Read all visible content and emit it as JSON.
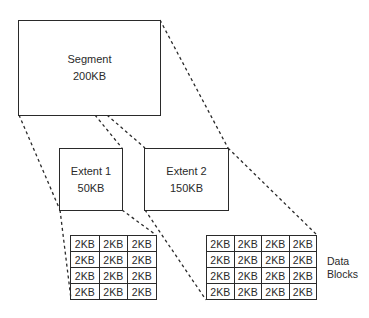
{
  "diagram": {
    "type": "storage hierarchy",
    "segment": {
      "title": "Segment",
      "size": "200KB"
    },
    "extents": [
      {
        "title": "Extent 1",
        "size": "50KB"
      },
      {
        "title": "Extent 2",
        "size": "150KB"
      }
    ],
    "data_blocks": {
      "label_line1": "Data",
      "label_line2": "Blocks",
      "block_size": "2KB",
      "grid1": {
        "rows": 4,
        "cols": 3,
        "cells": [
          [
            "2KB",
            "2KB",
            "2KB"
          ],
          [
            "2KB",
            "2KB",
            "2KB"
          ],
          [
            "2KB",
            "2KB",
            "2KB"
          ],
          [
            "2KB",
            "2KB",
            "2KB"
          ]
        ]
      },
      "grid2": {
        "rows": 4,
        "cols": 4,
        "cells": [
          [
            "2KB",
            "2KB",
            "2KB",
            "2KB"
          ],
          [
            "2KB",
            "2KB",
            "2KB",
            "2KB"
          ],
          [
            "2KB",
            "2KB",
            "2KB",
            "2KB"
          ],
          [
            "2KB",
            "2KB",
            "2KB",
            "2KB"
          ]
        ]
      }
    },
    "colors": {
      "stroke": "#2a2a2a",
      "background": "#ffffff"
    }
  }
}
